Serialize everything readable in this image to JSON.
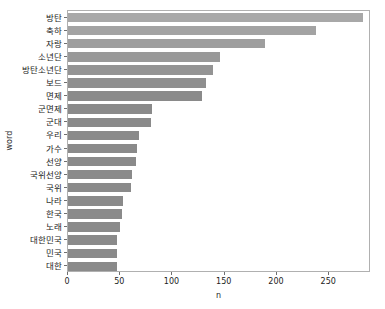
{
  "chart_data": {
    "type": "bar",
    "orientation": "horizontal",
    "title": "",
    "xlabel": "n",
    "ylabel": "word",
    "xlim": [
      0,
      290
    ],
    "ylim": null,
    "grid": false,
    "legend": null,
    "xticks": [
      0,
      50,
      100,
      150,
      200,
      250
    ],
    "categories": [
      "방탄",
      "축하",
      "자랑",
      "소년단",
      "방탄소년단",
      "보드",
      "면제",
      "군면제",
      "군대",
      "우리",
      "가수",
      "선양",
      "국위선양",
      "국위",
      "나라",
      "한국",
      "노래",
      "대한민국",
      "민국",
      "대한"
    ],
    "values": [
      282,
      237,
      189,
      145,
      139,
      132,
      128,
      80,
      79,
      68,
      66,
      65,
      61,
      60,
      53,
      52,
      50,
      47,
      47,
      47
    ],
    "bar_color": "#8a8a8a",
    "frame_color": "#b0b0b0",
    "text_color": "#1c1c1c"
  }
}
